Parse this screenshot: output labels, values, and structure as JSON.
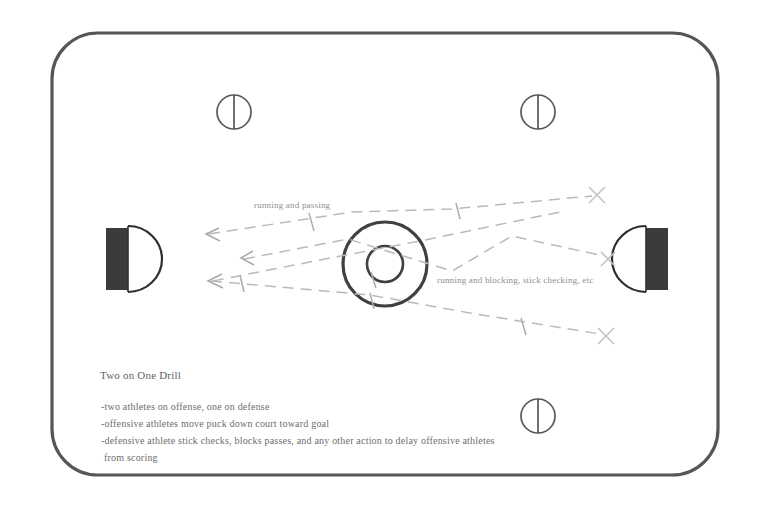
{
  "diagram": {
    "type": "hockey-rink-drill-diagram",
    "title": "Two on One Drill",
    "description_lines": [
      "-two athletes on offense, one on defense",
      "-offensive athletes move puck down court toward goal",
      "-defensive athlete stick checks, blocks passes, and any other action to delay offensive athletes",
      " from scoring"
    ],
    "annotations": [
      {
        "id": "running-and-passing",
        "label": "running and passing",
        "x": 254,
        "y": 200
      },
      {
        "id": "running-and-blocking",
        "label": "running and blocking, stick checking, etc",
        "x": 437,
        "y": 275
      }
    ],
    "colors": {
      "rink_outline": "#565659",
      "ink": "#6d6d70",
      "path_line": "#b9b9bd",
      "goal_fill": "#3a3a3c",
      "background": "#ffffff"
    },
    "rink": {
      "x": 52,
      "y": 33,
      "width": 666,
      "height": 442,
      "corner_radius": 46,
      "outline_width": 3.2
    },
    "center_line": {
      "x": 385,
      "y_top": 33,
      "y_bottom": 475,
      "width": 3.2
    },
    "center_circle": {
      "cx": 385,
      "cy": 264,
      "r_outer": 42,
      "r_inner": 18
    },
    "faceoff_circles": [
      {
        "id": "faceoff-top-left",
        "cx": 234,
        "cy": 112,
        "r": 17
      },
      {
        "id": "faceoff-top-right",
        "cx": 538,
        "cy": 112,
        "r": 17
      },
      {
        "id": "faceoff-bottom-right",
        "cx": 538,
        "cy": 416,
        "r": 17
      }
    ],
    "goals": [
      {
        "id": "goal-left",
        "x": 106,
        "y": 228,
        "width": 22,
        "height": 62,
        "side": "left"
      },
      {
        "id": "goal-right",
        "x": 646,
        "y": 228,
        "width": 22,
        "height": 62,
        "side": "right"
      }
    ],
    "markers": {
      "x_markers": [
        {
          "id": "x-marker-top-right",
          "cx": 597,
          "cy": 195
        },
        {
          "id": "x-marker-mid-right",
          "cx": 608,
          "cy": 259
        },
        {
          "id": "x-marker-bottom-right",
          "cx": 606,
          "cy": 336
        }
      ],
      "arrowheads": [
        {
          "id": "arrowhead-upper-left",
          "x": 206,
          "y": 234
        },
        {
          "id": "arrowhead-mid-left",
          "x": 241,
          "y": 258
        },
        {
          "id": "arrowhead-lower-left",
          "x": 208,
          "y": 281
        }
      ]
    }
  }
}
